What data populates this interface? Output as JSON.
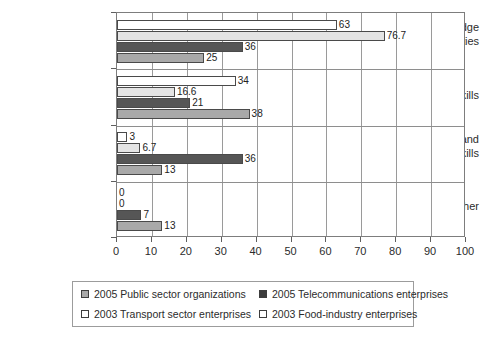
{
  "chart_data": {
    "type": "bar",
    "orientation": "horizontal",
    "title": "",
    "subtitle": "",
    "xlabel": "",
    "ylabel": "",
    "xlim": [
      0,
      100
    ],
    "xticks": [
      0,
      10,
      20,
      30,
      40,
      50,
      60,
      70,
      80,
      90,
      100
    ],
    "grid": true,
    "grid_axis": "x",
    "legend_position": "bottom",
    "categories": [
      "Technical knowledge and abilities",
      "Core skills",
      "Management and leadership skills",
      "Other"
    ],
    "category_lines": [
      [
        "Technical knowledge",
        "and abilities"
      ],
      [
        "Core skills"
      ],
      [
        "Management and",
        "leadership skills"
      ],
      [
        "Other"
      ]
    ],
    "series": [
      {
        "name": "2003 Food-industry enterprises",
        "color": "#ffffff",
        "values": [
          63,
          34,
          3,
          0
        ],
        "labels": [
          "63",
          "34",
          "3",
          "0"
        ]
      },
      {
        "name": "2003 Transport sector enterprises",
        "color": "#e4e4e4",
        "values": [
          76.7,
          16.6,
          6.7,
          0
        ],
        "labels": [
          "76.7",
          "16.6",
          "6.7",
          "0"
        ]
      },
      {
        "name": "2005 Telecommunications enterprises",
        "color": "#565656",
        "values": [
          36,
          21,
          36,
          7
        ],
        "labels": [
          "36",
          "21",
          "36",
          "7"
        ]
      },
      {
        "name": "2005 Public sector organizations",
        "color": "#a9a9a9",
        "values": [
          25,
          38,
          13,
          13
        ],
        "labels": [
          "25",
          "38",
          "13",
          "13"
        ]
      }
    ]
  },
  "legend": {
    "entries": [
      {
        "label": "2005 Public sector organizations",
        "color": "#a9a9a9"
      },
      {
        "label": "2005 Telecommunications enterprises",
        "color": "#3c3c3c"
      },
      {
        "label": "2003 Transport sector enterprises",
        "color": "#ffffff"
      },
      {
        "label": "2003 Food-industry enterprises",
        "color": "#ffffff"
      }
    ]
  }
}
